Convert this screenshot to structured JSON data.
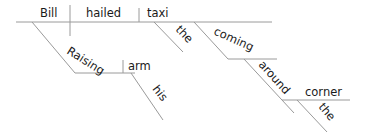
{
  "diagram": {
    "type": "sentence-diagram",
    "sentence_words": {
      "subject": "Bill",
      "verb": "hailed",
      "object": "taxi",
      "object_modifier": "the",
      "participle": "coming",
      "participle_adverb": "around",
      "preposition_object": "corner",
      "preposition_object_modifier": "the",
      "subject_participle": "Raising",
      "subject_participle_object": "arm",
      "subject_participle_object_modifier": "his"
    },
    "line_color": "#9a9a9a",
    "text_color": "#1a1a1a"
  }
}
